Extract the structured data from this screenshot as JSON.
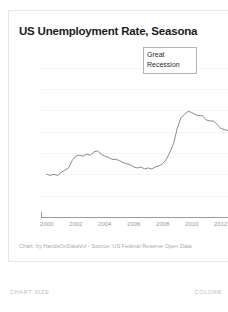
{
  "chart_card": {
    "title": "US Unemployment Rate, Seasona",
    "credit": "Chart: by HandsOnDataViz - Source: US Federal Reserve Open Data",
    "annotation": {
      "line1": "Great",
      "line2": "Recession"
    }
  },
  "footer": {
    "chart_size_label": "CHART SIZE",
    "colors_label": "COLORB"
  },
  "colors": {
    "line": "#8a8a8a",
    "axis": "#9a9a9a",
    "tick_text": "#a8a8a8",
    "title_text": "#1b1b1b",
    "card_border": "#e6e6e6",
    "annotation_border": "#b5b5b5",
    "background": "#ffffff"
  },
  "chart_data": {
    "type": "line",
    "title": "US Unemployment Rate, Seasona",
    "xlabel": "",
    "ylabel": "",
    "xlim": [
      1999.6,
      2013.4
    ],
    "ylim": [
      0,
      15
    ],
    "ytick_values": [
      14,
      12,
      10,
      8,
      6,
      4,
      2,
      0
    ],
    "ytick_labels": [
      "14",
      "12",
      "10",
      "8",
      "6",
      "4",
      "2",
      "0"
    ],
    "xtick_values": [
      2000,
      2002,
      2004,
      2006,
      2008,
      2010,
      2012
    ],
    "xtick_labels": [
      "2000",
      "2002",
      "2004",
      "2006",
      "2008",
      "2010",
      "2012"
    ],
    "grid": false,
    "legend": "none",
    "annotations": [
      {
        "text": "Great Recession",
        "x": 2008.6,
        "y": 11.9
      }
    ],
    "series": [
      {
        "name": "US Unemployment Rate",
        "x": [
          2000.0,
          2000.25,
          2000.5,
          2000.75,
          2001.0,
          2001.25,
          2001.5,
          2001.75,
          2002.0,
          2002.25,
          2002.5,
          2002.75,
          2003.0,
          2003.25,
          2003.5,
          2003.75,
          2004.0,
          2004.25,
          2004.5,
          2004.75,
          2005.0,
          2005.25,
          2005.5,
          2005.75,
          2006.0,
          2006.25,
          2006.5,
          2006.75,
          2007.0,
          2007.25,
          2007.5,
          2007.75,
          2008.0,
          2008.25,
          2008.5,
          2008.75,
          2009.0,
          2009.25,
          2009.5,
          2009.75,
          2010.0,
          2010.25,
          2010.5,
          2010.75,
          2011.0,
          2011.25,
          2011.5,
          2011.75,
          2012.0,
          2012.25,
          2012.5,
          2012.75,
          2013.0,
          2013.25
        ],
        "y": [
          4.0,
          3.9,
          4.0,
          3.9,
          4.2,
          4.4,
          4.6,
          5.3,
          5.7,
          5.8,
          5.7,
          5.9,
          5.8,
          6.1,
          6.2,
          5.9,
          5.7,
          5.6,
          5.4,
          5.4,
          5.3,
          5.1,
          5.0,
          4.9,
          4.7,
          4.6,
          4.7,
          4.5,
          4.6,
          4.5,
          4.7,
          4.8,
          5.0,
          5.4,
          6.1,
          6.9,
          8.3,
          9.3,
          9.6,
          9.9,
          9.8,
          9.6,
          9.5,
          9.5,
          9.1,
          9.0,
          9.0,
          8.7,
          8.3,
          8.2,
          8.1,
          7.8,
          7.7,
          7.5
        ]
      }
    ]
  }
}
